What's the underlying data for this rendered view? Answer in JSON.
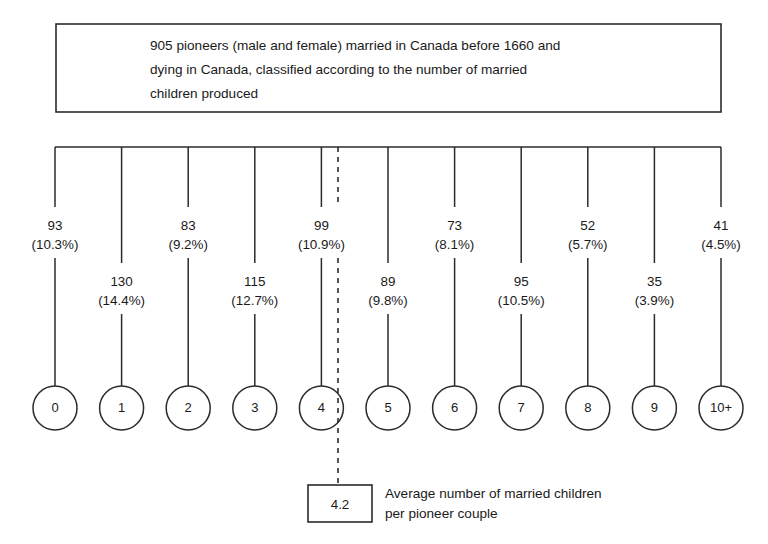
{
  "title": {
    "lines": [
      "905 pioneers (male and female) married in Canada before 1660 and",
      "dying in Canada, classified according to the number of married",
      "children produced"
    ]
  },
  "average": {
    "value": "4.2",
    "caption_lines": [
      "Average number of married children",
      "per pioneer couple"
    ],
    "marker_category": "4"
  },
  "colors": {
    "line": "#2b2b2b",
    "text": "#1a1a1a",
    "background": "#ffffff"
  },
  "chart_data": {
    "type": "bar",
    "title": "905 pioneers (male and female) married in Canada before 1660 and dying in Canada, classified according to the number of married children produced",
    "xlabel": "Number of married children produced",
    "ylabel": "Number of pioneers",
    "categories": [
      "0",
      "1",
      "2",
      "3",
      "4",
      "5",
      "6",
      "7",
      "8",
      "9",
      "10+"
    ],
    "values": [
      93,
      130,
      83,
      115,
      99,
      89,
      73,
      95,
      52,
      35,
      41
    ],
    "percent_labels": [
      "(10.3%)",
      "(14.4%)",
      "(9.2%)",
      "(12.7%)",
      "(10.9%)",
      "(9.8%)",
      "(8.1%)",
      "(10.5%)",
      "(5.7%)",
      "(3.9%)",
      "(4.5%)"
    ],
    "percents": [
      10.3,
      14.4,
      9.2,
      12.7,
      10.9,
      9.8,
      8.1,
      10.5,
      5.7,
      3.9,
      4.5
    ],
    "total": 905,
    "annotations": [
      {
        "text": "4.2",
        "label": "Average number of married children per pioneer couple",
        "at_category": "4"
      }
    ],
    "legend": "none",
    "grid": false
  }
}
